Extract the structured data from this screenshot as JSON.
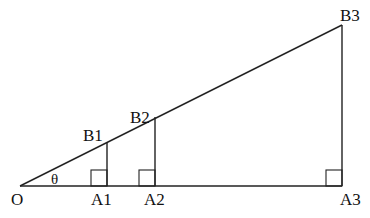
{
  "diagram": {
    "type": "similar-right-triangles",
    "angle_label": "θ",
    "points": {
      "O": {
        "label": "O",
        "x": 20,
        "y": 186
      },
      "A1": {
        "label": "A1",
        "x": 107,
        "y": 186
      },
      "A2": {
        "label": "A2",
        "x": 155,
        "y": 186
      },
      "A3": {
        "label": "A3",
        "x": 342,
        "y": 186
      },
      "B1": {
        "label": "B1",
        "x": 107,
        "y": 142
      },
      "B2": {
        "label": "B2",
        "x": 155,
        "y": 117
      },
      "B3": {
        "label": "B3",
        "x": 342,
        "y": 25
      }
    },
    "colors": {
      "line": "#222222",
      "text": "#111111",
      "background": "#ffffff"
    }
  }
}
